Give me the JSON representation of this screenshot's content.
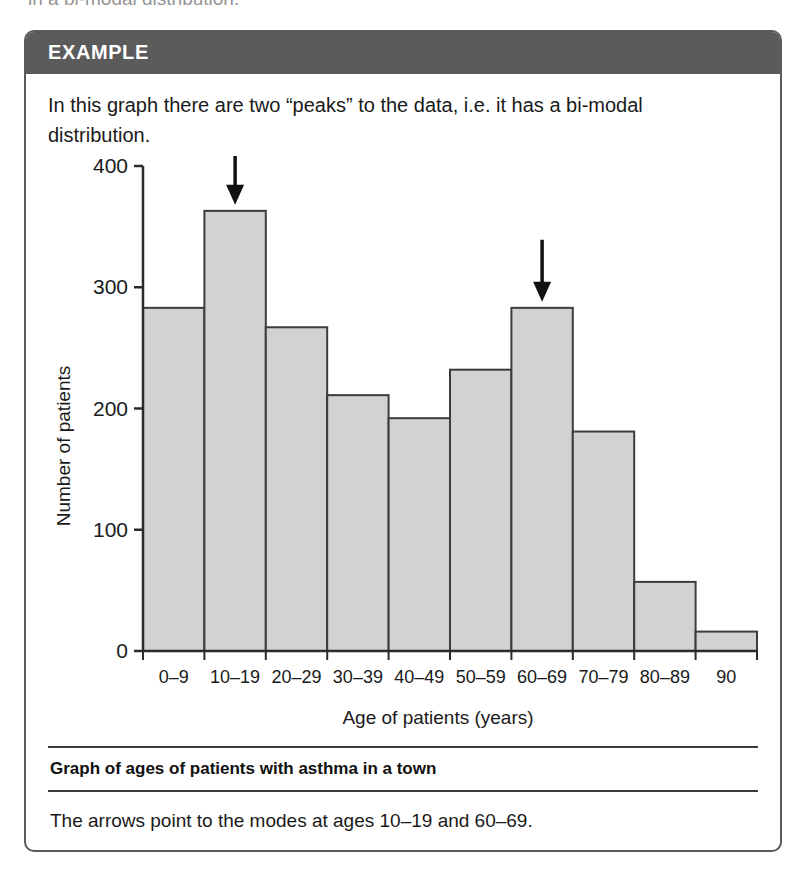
{
  "cutoff_text": "in a bi-modal distribution.",
  "example_box": {
    "header_label": "EXAMPLE",
    "intro_text": "In this graph there are two “peaks” to the data, i.e. it has a bi-modal distribution.",
    "caption_title": "Graph of ages of patients with asthma in a town",
    "footer_note": "The arrows point to the modes at ages 10–19 and 60–69."
  },
  "colors": {
    "header_bg": "#5b5b5b",
    "box_border": "#5b5b5b",
    "bar_fill": "#d2d2d2",
    "bar_stroke": "#3c3c3c",
    "axis": "#2b2b2b",
    "text": "#1a1a1a",
    "arrow": "#111111"
  },
  "chart_data": {
    "type": "bar",
    "title": "",
    "xlabel": "Age of patients (years)",
    "ylabel": "Number of patients",
    "categories": [
      "0–9",
      "10–19",
      "20–29",
      "30–39",
      "40–49",
      "50–59",
      "60–69",
      "70–79",
      "80–89",
      "90"
    ],
    "values": [
      283,
      363,
      267,
      211,
      192,
      232,
      283,
      181,
      57,
      16
    ],
    "ylim": [
      0,
      400
    ],
    "yticks": [
      0,
      100,
      200,
      300,
      400
    ],
    "ytick_labels": [
      "0",
      "100",
      "200",
      "300",
      "400"
    ],
    "grid": false,
    "legend": null,
    "annotations": [
      {
        "label": "mode-arrow",
        "category": "10–19",
        "text": ""
      },
      {
        "label": "mode-arrow",
        "category": "60–69",
        "text": ""
      }
    ]
  }
}
